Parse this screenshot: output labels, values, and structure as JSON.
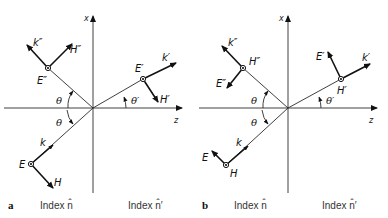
{
  "figure": {
    "panels": [
      {
        "id": "a",
        "label": "a",
        "axis_x": "x",
        "axis_z": "z",
        "index_left": "Index n̂",
        "index_right": "Index n̂′",
        "incident": {
          "k": "k",
          "field_dot": "E",
          "field_arrow": "H",
          "angle": "θ"
        },
        "reflected": {
          "k": "k″",
          "field_dot": "E″",
          "field_arrow": "H″",
          "angle": "θ"
        },
        "transmitted": {
          "k": "k′",
          "field_dot": "E′",
          "field_arrow": "H′",
          "angle": "θ′"
        }
      },
      {
        "id": "b",
        "label": "b",
        "axis_x": "x",
        "axis_z": "z",
        "index_left": "Index n̂",
        "index_right": "Index n̂′",
        "incident": {
          "k": "k",
          "field_dot": "H",
          "field_arrow": "E",
          "angle": "θ"
        },
        "reflected": {
          "k": "k″",
          "field_dot": "H″",
          "field_arrow": "E″",
          "angle": "θ"
        },
        "transmitted": {
          "k": "k′",
          "field_dot": "H′",
          "field_arrow": "E′",
          "angle": "θ′"
        }
      }
    ]
  }
}
